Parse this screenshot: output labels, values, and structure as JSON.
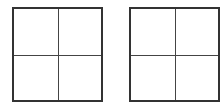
{
  "diagram": {
    "grids": [
      {
        "id": "grid-a",
        "rows": 2,
        "cols": 2,
        "border_color": "#333333",
        "line_color": "#444444"
      },
      {
        "id": "grid-b",
        "rows": 2,
        "cols": 2,
        "border_color": "#333333",
        "line_color": "#444444"
      }
    ]
  }
}
